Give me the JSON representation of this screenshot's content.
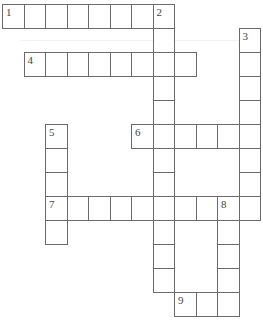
{
  "puzzle": {
    "type": "crossword",
    "cell_width": 21.5,
    "cell_height": 24,
    "origin_x": 2,
    "origin_y": 4,
    "border_color": "#6a6a6a",
    "background_color": "#ffffff",
    "words": [
      {
        "number": "1",
        "direction": "across",
        "row": 0,
        "col": 0,
        "length": 8
      },
      {
        "number": "2",
        "direction": "down",
        "row": 0,
        "col": 7,
        "length": 12
      },
      {
        "number": "3",
        "direction": "down",
        "row": 1,
        "col": 11,
        "length": 8
      },
      {
        "number": "4",
        "direction": "across",
        "row": 2,
        "col": 1,
        "length": 8
      },
      {
        "number": "5",
        "direction": "down",
        "row": 5,
        "col": 2,
        "length": 5
      },
      {
        "number": "6",
        "direction": "across",
        "row": 5,
        "col": 6,
        "length": 6
      },
      {
        "number": "7",
        "direction": "across",
        "row": 8,
        "col": 2,
        "length": 10
      },
      {
        "number": "8",
        "direction": "down",
        "row": 8,
        "col": 10,
        "length": 5
      },
      {
        "number": "9",
        "direction": "across",
        "row": 12,
        "col": 8,
        "length": 3
      }
    ]
  }
}
